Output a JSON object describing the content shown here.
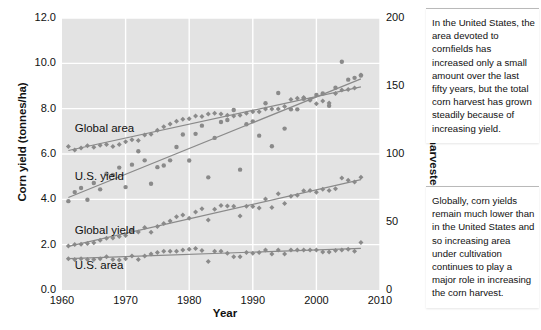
{
  "chart_data": {
    "type": "scatter",
    "title": "",
    "xlabel": "Year",
    "ylabel": "Corn yield (tonnes/ha)",
    "ylabel_right": "Corn area harvested (million ha)",
    "xlim": [
      1960,
      2010
    ],
    "ylim": [
      0.0,
      12.0
    ],
    "ylim_right": [
      0,
      200
    ],
    "grid": true,
    "legend_position": "inline-labels",
    "xticks": [
      "1960",
      "1970",
      "1980",
      "1990",
      "2000",
      "2010"
    ],
    "xtick_values": [
      1960,
      1970,
      1980,
      1990,
      2000,
      2010
    ],
    "yticks_left": [
      "0.0",
      "2.0",
      "4.0",
      "6.0",
      "8.0",
      "10.0",
      "12.0"
    ],
    "ytick_values_left": [
      0.0,
      2.0,
      4.0,
      6.0,
      8.0,
      10.0,
      12.0
    ],
    "yticks_right": [
      "0",
      "50",
      "100",
      "150",
      "200"
    ],
    "ytick_values_right": [
      0,
      50,
      100,
      150,
      200
    ],
    "series": [
      {
        "name": "Global area",
        "label": "Global area",
        "axis": "right",
        "unit": "million ha",
        "marker": "diamond",
        "color": "#8a8a8a",
        "trendline": true,
        "label_x": 1962.0,
        "label_y_left": 7.1,
        "x": [
          1961,
          1962,
          1963,
          1964,
          1965,
          1966,
          1967,
          1968,
          1969,
          1970,
          1971,
          1972,
          1973,
          1974,
          1975,
          1976,
          1977,
          1978,
          1979,
          1980,
          1981,
          1982,
          1983,
          1984,
          1985,
          1986,
          1987,
          1988,
          1989,
          1990,
          1991,
          1992,
          1993,
          1994,
          1995,
          1996,
          1997,
          1998,
          1999,
          2000,
          2001,
          2002,
          2003,
          2004,
          2005,
          2006,
          2007
        ],
        "values": [
          105.5,
          103.0,
          104.5,
          106.0,
          105.0,
          106.5,
          107.0,
          105.5,
          107.0,
          109.0,
          110.5,
          110.0,
          114.0,
          114.5,
          117.5,
          120.0,
          122.0,
          124.0,
          125.5,
          126.0,
          128.0,
          127.5,
          129.5,
          130.0,
          129.5,
          128.5,
          128.0,
          128.5,
          130.0,
          131.0,
          131.0,
          133.0,
          133.0,
          133.0,
          135.0,
          140.0,
          141.0,
          141.5,
          139.5,
          137.0,
          139.0,
          137.5,
          144.5,
          147.0,
          147.5,
          148.5,
          158.0
        ]
      },
      {
        "name": "U.S. yield",
        "label": "U.S. yield",
        "axis": "left",
        "unit": "tonnes/ha",
        "marker": "circle",
        "color": "#8a8a8a",
        "trendline": true,
        "label_x": 1962.0,
        "label_y_left": 5.0,
        "x": [
          1961,
          1962,
          1963,
          1964,
          1965,
          1966,
          1967,
          1968,
          1969,
          1970,
          1971,
          1972,
          1973,
          1974,
          1975,
          1976,
          1977,
          1978,
          1979,
          1980,
          1981,
          1982,
          1983,
          1984,
          1985,
          1986,
          1987,
          1988,
          1989,
          1990,
          1991,
          1992,
          1993,
          1994,
          1995,
          1996,
          1997,
          1998,
          1999,
          2000,
          2001,
          2002,
          2003,
          2004,
          2005,
          2006,
          2007
        ],
        "values": [
          3.92,
          4.32,
          4.5,
          3.98,
          4.72,
          4.44,
          5.13,
          5.08,
          5.4,
          4.54,
          5.53,
          6.12,
          5.72,
          4.69,
          5.42,
          5.49,
          5.72,
          6.31,
          6.86,
          5.71,
          6.89,
          7.25,
          4.97,
          6.71,
          7.41,
          7.5,
          7.94,
          5.31,
          7.31,
          7.44,
          6.81,
          8.24,
          6.34,
          8.69,
          7.12,
          7.97,
          7.97,
          8.44,
          8.4,
          8.6,
          8.67,
          8.13,
          8.92,
          10.07,
          9.28,
          9.36,
          9.46
        ]
      },
      {
        "name": "Global yield",
        "label": "Global yield",
        "axis": "left",
        "unit": "tonnes/ha",
        "marker": "diamond",
        "color": "#8a8a8a",
        "trendline": true,
        "label_x": 1962.0,
        "label_y_left": 2.6,
        "x": [
          1961,
          1962,
          1963,
          1964,
          1965,
          1966,
          1967,
          1968,
          1969,
          1970,
          1971,
          1972,
          1973,
          1974,
          1975,
          1976,
          1977,
          1978,
          1979,
          1980,
          1981,
          1982,
          1983,
          1984,
          1985,
          1986,
          1987,
          1988,
          1989,
          1990,
          1991,
          1992,
          1993,
          1994,
          1995,
          1996,
          1997,
          1998,
          1999,
          2000,
          2001,
          2002,
          2003,
          2004,
          2005,
          2006,
          2007
        ],
        "values": [
          1.94,
          2.01,
          2.02,
          2.05,
          2.09,
          2.19,
          2.28,
          2.29,
          2.36,
          2.4,
          2.64,
          2.56,
          2.76,
          2.55,
          2.8,
          2.93,
          3.04,
          3.23,
          3.31,
          3.16,
          3.44,
          3.58,
          3.09,
          3.56,
          3.73,
          3.71,
          3.7,
          3.26,
          3.7,
          3.68,
          3.62,
          4.01,
          3.64,
          4.25,
          3.82,
          4.14,
          4.18,
          4.38,
          4.39,
          4.31,
          4.45,
          4.39,
          4.47,
          4.94,
          4.84,
          4.77,
          4.97
        ]
      },
      {
        "name": "U.S. area",
        "label": "U.S. area",
        "axis": "right",
        "unit": "million ha",
        "marker": "diamond",
        "color": "#8a8a8a",
        "trendline": true,
        "label_x": 1962.0,
        "label_y_left": 1.05,
        "x": [
          1961,
          1962,
          1963,
          1964,
          1965,
          1966,
          1967,
          1968,
          1969,
          1970,
          1971,
          1972,
          1973,
          1974,
          1975,
          1976,
          1977,
          1978,
          1979,
          1980,
          1981,
          1982,
          1983,
          1984,
          1985,
          1986,
          1987,
          1988,
          1989,
          1990,
          1991,
          1992,
          1993,
          1994,
          1995,
          1996,
          1997,
          1998,
          1999,
          2000,
          2001,
          2002,
          2003,
          2004,
          2005,
          2006,
          2007
        ],
        "values": [
          23.0,
          22.5,
          23.0,
          22.5,
          22.5,
          23.0,
          24.5,
          22.5,
          22.0,
          23.0,
          25.0,
          22.5,
          25.0,
          26.5,
          27.5,
          28.5,
          28.5,
          28.5,
          29.5,
          30.0,
          30.5,
          29.0,
          21.0,
          28.5,
          28.5,
          27.0,
          24.5,
          24.5,
          27.5,
          27.0,
          27.5,
          29.5,
          26.5,
          29.5,
          26.5,
          29.5,
          29.5,
          29.5,
          29.5,
          29.5,
          28.0,
          28.0,
          29.0,
          29.5,
          30.0,
          28.5,
          35.0
        ]
      }
    ]
  },
  "notes": [
    {
      "id": "note-us",
      "text": "In the United States, the area devoted to cornfields has increased only a small amount over the last fifty years, but the total corn harvest has grown steadily because of increasing yield."
    },
    {
      "id": "note-global",
      "text": "Globally, corn yields remain much lower than in the United States and so increasing area under cultivation continues to play a major role in increasing the corn harvest."
    }
  ],
  "colors": {
    "plot_background": "#e3e3e3",
    "gridline": "#ffffff",
    "marker": "#8a8a8a",
    "trendline": "#8a8a8a",
    "axis": "#555555",
    "text": "#111111"
  }
}
